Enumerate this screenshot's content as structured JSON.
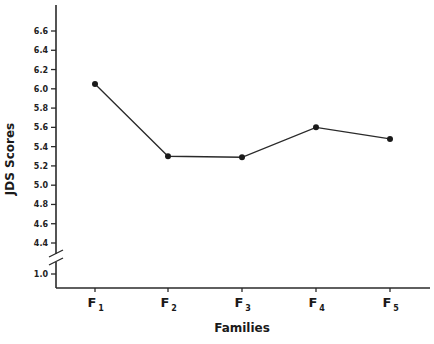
{
  "chart_data": {
    "type": "line",
    "title": "",
    "xlabel": "Families",
    "ylabel": "JDS Scores",
    "categories": [
      "F1",
      "F2",
      "F3",
      "F4",
      "F5"
    ],
    "category_labels": [
      {
        "main": "F",
        "sub": "1"
      },
      {
        "main": "F",
        "sub": "2"
      },
      {
        "main": "F",
        "sub": "3"
      },
      {
        "main": "F",
        "sub": "4"
      },
      {
        "main": "F",
        "sub": "5"
      }
    ],
    "series": [
      {
        "name": "JDS Scores",
        "values": [
          6.05,
          5.3,
          5.29,
          5.6,
          5.48
        ]
      }
    ],
    "yticks": [
      1.0,
      4.4,
      4.6,
      4.8,
      5.0,
      5.2,
      5.4,
      5.6,
      5.8,
      6.0,
      6.2,
      6.4,
      6.6
    ],
    "ytick_labels": [
      "1.0",
      "4.4",
      "4.6",
      "4.8",
      "5.0",
      "5.2",
      "5.4",
      "5.6",
      "5.8",
      "6.0",
      "6.2",
      "6.4",
      "6.6"
    ],
    "ylim": [
      1.0,
      6.6
    ],
    "axis_break": {
      "between": [
        1.0,
        4.4
      ]
    },
    "grid": false,
    "legend": "none",
    "markers": "filled-circle",
    "line_color": "#2a2a2a"
  }
}
